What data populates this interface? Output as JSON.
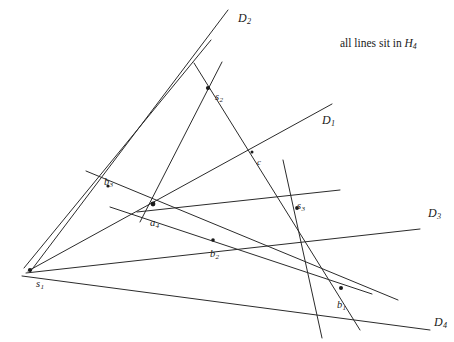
{
  "figure": {
    "width": 454,
    "height": 342,
    "background": "#ffffff",
    "stroke_color": "#2b2b2b",
    "stroke_width": 1.0,
    "node_color": "#1a1a1a"
  },
  "annotation": {
    "prefix": "all lines sit in ",
    "symbol": "H",
    "subscript": "4",
    "full_text": "all lines sit in H4",
    "x": 340,
    "y": 37
  },
  "point_labels": [
    {
      "name": "s1",
      "base": "s",
      "sub": "1",
      "x": 36,
      "y": 279,
      "node_x": 30,
      "node_y": 270
    },
    {
      "name": "s2",
      "base": "s",
      "sub": "2",
      "x": 215,
      "y": 92,
      "node_x": 208,
      "node_y": 88
    },
    {
      "name": "s3",
      "base": "s",
      "sub": "3",
      "x": 297,
      "y": 201,
      "node_x": 297,
      "node_y": 208
    },
    {
      "name": "a4",
      "base": "a",
      "sub": "4",
      "x": 150,
      "y": 218,
      "node_x": 153,
      "node_y": 204
    },
    {
      "name": "b1",
      "base": "b",
      "sub": "1",
      "x": 337,
      "y": 300,
      "node_x": 341,
      "node_y": 288
    },
    {
      "name": "b2",
      "base": "b",
      "sub": "2",
      "x": 210,
      "y": 249,
      "node_x": 213,
      "node_y": 240
    },
    {
      "name": "b3",
      "base": "b",
      "sub": "3",
      "x": 104,
      "y": 177,
      "node_x": 108,
      "node_y": 186
    },
    {
      "name": "c",
      "base": "c",
      "sub": "",
      "x": 257,
      "y": 158,
      "node_x": 252,
      "node_y": 152
    }
  ],
  "line_labels": [
    {
      "name": "D2",
      "base": "D",
      "sub": "2",
      "x": 238,
      "y": 12
    },
    {
      "name": "D1",
      "base": "D",
      "sub": "1",
      "x": 322,
      "y": 114
    },
    {
      "name": "D3",
      "base": "D",
      "sub": "3",
      "x": 428,
      "y": 207
    },
    {
      "name": "D4",
      "base": "D",
      "sub": "4",
      "x": 434,
      "y": 316
    }
  ],
  "lines": [
    {
      "name": "line-D2",
      "x1": 228,
      "y1": 10,
      "x2": 30,
      "y2": 272
    },
    {
      "name": "line-D1",
      "x1": 332,
      "y1": 104,
      "x2": 28,
      "y2": 271
    },
    {
      "name": "line-D3",
      "x1": 420,
      "y1": 229,
      "x2": 26,
      "y2": 273
    },
    {
      "name": "line-D4",
      "x1": 430,
      "y1": 330,
      "x2": 22,
      "y2": 276
    },
    {
      "name": "line-s1-a4-s2-top",
      "x1": 24,
      "y1": 268,
      "x2": 211,
      "y2": 40
    },
    {
      "name": "line-s2-b1",
      "x1": 194,
      "y1": 63,
      "x2": 360,
      "y2": 330
    },
    {
      "name": "line-s2-a4-down",
      "x1": 222,
      "y1": 62,
      "x2": 140,
      "y2": 222
    },
    {
      "name": "line-b3-a4-s3",
      "x1": 86,
      "y1": 171,
      "x2": 398,
      "y2": 300
    },
    {
      "name": "line-a4-horizontal",
      "x1": 110,
      "y1": 207,
      "x2": 372,
      "y2": 294
    },
    {
      "name": "line-a4-s3-right",
      "x1": 137,
      "y1": 212,
      "x2": 340,
      "y2": 190
    },
    {
      "name": "line-s3-vertical",
      "x1": 283,
      "y1": 160,
      "x2": 322,
      "y2": 338
    }
  ],
  "nodes": [
    {
      "name": "node-s1",
      "x": 30,
      "y": 270,
      "r": 2.1
    },
    {
      "name": "node-s2",
      "x": 208,
      "y": 88,
      "r": 2.1
    },
    {
      "name": "node-s3",
      "x": 297,
      "y": 208,
      "r": 1.9
    },
    {
      "name": "node-a4",
      "x": 153,
      "y": 204,
      "r": 2.4
    },
    {
      "name": "node-b1",
      "x": 341,
      "y": 288,
      "r": 2.0
    },
    {
      "name": "node-b2",
      "x": 213,
      "y": 240,
      "r": 1.8
    },
    {
      "name": "node-b3",
      "x": 108,
      "y": 186,
      "r": 1.6
    },
    {
      "name": "node-c",
      "x": 252,
      "y": 152,
      "r": 1.5
    }
  ]
}
